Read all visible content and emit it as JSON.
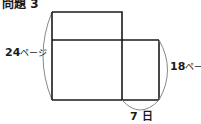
{
  "title": "問題 3",
  "diagram": {
    "left_label": {
      "value": "24",
      "unit": "ページ"
    },
    "right_label": {
      "value": "18",
      "unit": "ページ"
    },
    "bottom_label": {
      "value": "7",
      "unit": "日"
    }
  },
  "colors": {
    "line": "#1a1a1a",
    "brace": "#888888",
    "background": "#ffffff"
  }
}
